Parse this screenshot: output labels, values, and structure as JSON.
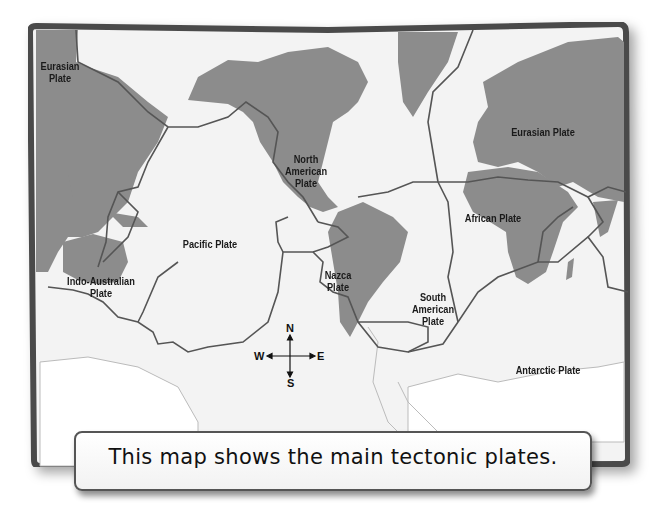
{
  "map": {
    "title": "Tectonic plates world map",
    "colors": {
      "land": "#8c8c8c",
      "ocean": "#f3f3f3",
      "frame": "#4a4a4a",
      "boundary": "#555555",
      "antarctica": "#ffffff"
    },
    "plates": [
      {
        "id": "eurasian-west",
        "label": "Eurasian\nPlate"
      },
      {
        "id": "north-american",
        "label": "North\nAmerican\nPlate"
      },
      {
        "id": "eurasian-east",
        "label": "Eurasian Plate"
      },
      {
        "id": "african",
        "label": "African Plate"
      },
      {
        "id": "pacific",
        "label": "Pacific Plate"
      },
      {
        "id": "indo-australian",
        "label": "Indo-Australian\nPlate"
      },
      {
        "id": "nazca",
        "label": "Nazca\nPlate"
      },
      {
        "id": "south-american",
        "label": "South\nAmerican\nPlate"
      },
      {
        "id": "antarctic",
        "label": "Antarctic Plate"
      }
    ],
    "compass": {
      "north": "N",
      "south": "S",
      "east": "E",
      "west": "W"
    }
  },
  "caption": {
    "text": "This map shows the main tectonic plates."
  }
}
